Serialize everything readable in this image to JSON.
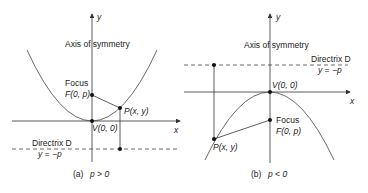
{
  "figure_a": {
    "caption_prefix": "(a)",
    "caption_cond": "p > 0",
    "axis_x_label": "x",
    "axis_y_label": "y",
    "axis_of_symmetry": "Axis of symmetry",
    "focus_title": "Focus",
    "focus_coord": "F(0, p)",
    "point_label": "P(x, y)",
    "vertex_label": "V(0, 0)",
    "directrix_title": "Directrix D",
    "directrix_eq": "y = −p"
  },
  "figure_b": {
    "caption_prefix": "(b)",
    "caption_cond": "p < 0",
    "axis_x_label": "x",
    "axis_y_label": "y",
    "axis_of_symmetry": "Axis of symmetry",
    "focus_title": "Focus",
    "focus_coord": "F(0, p)",
    "point_label": "P(x, y)",
    "vertex_label": "V(0, 0)",
    "directrix_title": "Directrix D",
    "directrix_eq": "y = −p"
  },
  "colors": {
    "line": "#333333",
    "text": "#222222"
  }
}
